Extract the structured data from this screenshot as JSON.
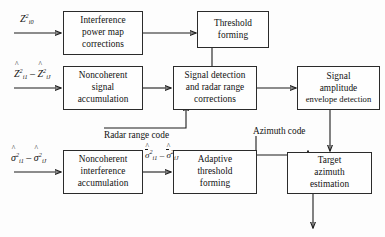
{
  "diagram": {
    "background_color": "#fdfdfd",
    "line_color": "#1d1d1d",
    "text_color": "#111111",
    "boxes": [
      {
        "id": "interference_power_map",
        "lines": [
          "Interference",
          "power map",
          "corrections"
        ]
      },
      {
        "id": "threshold_forming",
        "lines": [
          "Threshold",
          "forming"
        ]
      },
      {
        "id": "noncoherent_signal",
        "lines": [
          "Noncoherent",
          "signal",
          "accumulation"
        ]
      },
      {
        "id": "signal_detection",
        "lines": [
          "Signal detection",
          "and radar range",
          "corrections"
        ]
      },
      {
        "id": "signal_amplitude",
        "lines": [
          "Signal",
          "amplitude",
          "envelope detection"
        ]
      },
      {
        "id": "noncoherent_interference",
        "lines": [
          "Noncoherent",
          "interference",
          "accumulation"
        ]
      },
      {
        "id": "adaptive_threshold",
        "lines": [
          "Adaptive",
          "threshold",
          "forming"
        ]
      },
      {
        "id": "target_azimuth",
        "lines": [
          "Target",
          "azimuth",
          "estimation"
        ]
      }
    ],
    "labels": {
      "radar_range_code": "Radar range code",
      "azimuth_code": "Azimuth code"
    },
    "math": {
      "input_z_i0": "Z²i0",
      "input_z_range": "Ẑ²i1 – Ẑ²iJ",
      "input_sigma_range": "σ̂²i1 – σ̂²iJ",
      "sigma_bar_range": "σ̄̂²i1 – σ̄̂²iJ"
    }
  }
}
